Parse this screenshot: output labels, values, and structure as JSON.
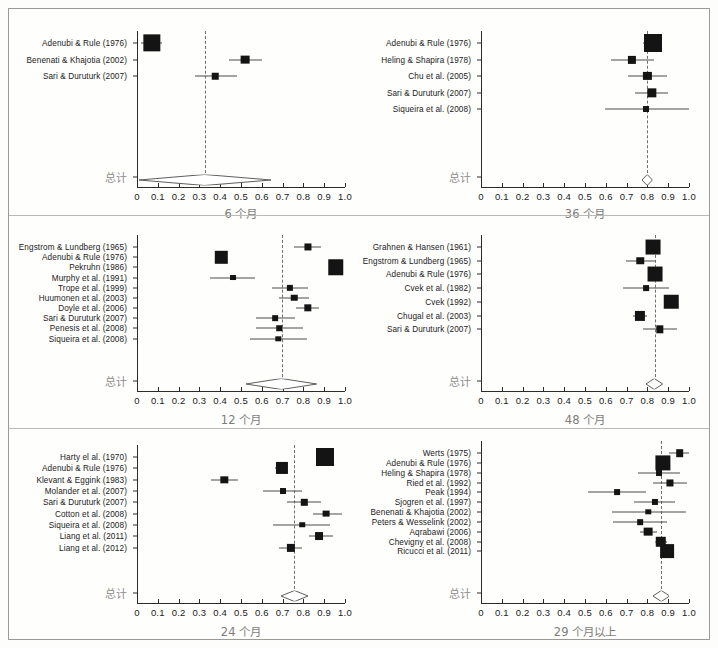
{
  "figure": {
    "x_tick_labels": [
      "0",
      "0.1",
      "0.2",
      "0.3",
      "0.4",
      "0.5",
      "0.6",
      "0.7",
      "0.8",
      "0.9",
      "1.0"
    ],
    "x_ticks": [
      0,
      0.1,
      0.2,
      0.3,
      0.4,
      0.5,
      0.6,
      0.7,
      0.8,
      0.9,
      1.0
    ],
    "summary_row_label": "总计",
    "xlim": [
      0,
      1.0
    ],
    "grid": false,
    "legend": "none"
  },
  "chart_data": [
    {
      "type": "forest",
      "panel_index": 0,
      "title": "6 个月",
      "xlabel": "6 个月",
      "ylabel": "",
      "xlim": [
        0,
        1.0
      ],
      "xticks": [
        0,
        0.1,
        0.2,
        0.3,
        0.4,
        0.5,
        0.6,
        0.7,
        0.8,
        0.9,
        1.0
      ],
      "reference_line": 0.325,
      "studies": [
        {
          "label": "Adenubi & Rule (1976)",
          "estimate": 0.07,
          "ci_low": 0.02,
          "ci_high": 0.12,
          "weight": 0.95
        },
        {
          "label": "Benenati & Khajotia (2002)",
          "estimate": 0.52,
          "ci_low": 0.44,
          "ci_high": 0.6,
          "weight": 0.34
        },
        {
          "label": "Sari & Duruturk (2007)",
          "estimate": 0.375,
          "ci_low": 0.28,
          "ci_high": 0.48,
          "weight": 0.18
        }
      ],
      "summary": {
        "label": "总计",
        "estimate": 0.325,
        "ci_low": 0.01,
        "ci_high": 0.645
      }
    },
    {
      "type": "forest",
      "panel_index": 1,
      "title": "36 个月",
      "xlabel": "36 个月",
      "ylabel": "",
      "xlim": [
        0,
        1.0
      ],
      "xticks": [
        0,
        0.1,
        0.2,
        0.3,
        0.4,
        0.5,
        0.6,
        0.7,
        0.8,
        0.9,
        1.0
      ],
      "reference_line": 0.8,
      "studies": [
        {
          "label": "Adenubi & Rule (1976)",
          "estimate": 0.825,
          "ci_low": 0.78,
          "ci_high": 0.87,
          "weight": 1.0
        },
        {
          "label": "Heling & Shapira (1978)",
          "estimate": 0.725,
          "ci_low": 0.625,
          "ci_high": 0.83,
          "weight": 0.3
        },
        {
          "label": "Chu et al. (2005)",
          "estimate": 0.8,
          "ci_low": 0.705,
          "ci_high": 0.895,
          "weight": 0.3
        },
        {
          "label": "Sari & Duruturk (2007)",
          "estimate": 0.82,
          "ci_low": 0.74,
          "ci_high": 0.9,
          "weight": 0.38
        },
        {
          "label": "Siqueira et al. (2008)",
          "estimate": 0.795,
          "ci_low": 0.595,
          "ci_high": 1.0,
          "weight": 0.14
        }
      ],
      "summary": {
        "label": "总计",
        "estimate": 0.8,
        "ci_low": 0.775,
        "ci_high": 0.825
      }
    },
    {
      "type": "forest",
      "panel_index": 2,
      "title": "12 个月",
      "xlabel": "12 个月",
      "ylabel": "",
      "xlim": [
        0,
        1.0
      ],
      "xticks": [
        0,
        0.1,
        0.2,
        0.3,
        0.4,
        0.5,
        0.6,
        0.7,
        0.8,
        0.9,
        1.0
      ],
      "reference_line": 0.695,
      "studies": [
        {
          "label": "Engstrom & Lundberg (1965)",
          "estimate": 0.82,
          "ci_low": 0.755,
          "ci_high": 0.885,
          "weight": 0.22
        },
        {
          "label": "Adenubi & Rule (1976)",
          "estimate": 0.405,
          "ci_low": 0.375,
          "ci_high": 0.435,
          "weight": 0.6
        },
        {
          "label": "Pekruhn (1986)",
          "estimate": 0.955,
          "ci_low": 0.935,
          "ci_high": 0.975,
          "weight": 0.82
        },
        {
          "label": "Murphy et al. (1991)",
          "estimate": 0.46,
          "ci_low": 0.35,
          "ci_high": 0.565,
          "weight": 0.14
        },
        {
          "label": "Trope et al. (1999)",
          "estimate": 0.735,
          "ci_low": 0.65,
          "ci_high": 0.82,
          "weight": 0.16
        },
        {
          "label": "Huumonen et al. (2003)",
          "estimate": 0.755,
          "ci_low": 0.685,
          "ci_high": 0.825,
          "weight": 0.18
        },
        {
          "label": "Doyle et al. (2006)",
          "estimate": 0.82,
          "ci_low": 0.765,
          "ci_high": 0.875,
          "weight": 0.24
        },
        {
          "label": "Sari & Duruturk (2007)",
          "estimate": 0.665,
          "ci_low": 0.57,
          "ci_high": 0.76,
          "weight": 0.12
        },
        {
          "label": "Penesis et al. (2008)",
          "estimate": 0.685,
          "ci_low": 0.57,
          "ci_high": 0.8,
          "weight": 0.11
        },
        {
          "label": "Siqueira et al. (2008)",
          "estimate": 0.68,
          "ci_low": 0.545,
          "ci_high": 0.815,
          "weight": 0.1
        }
      ],
      "summary": {
        "label": "总计",
        "estimate": 0.695,
        "ci_low": 0.525,
        "ci_high": 0.865
      }
    },
    {
      "type": "forest",
      "panel_index": 3,
      "title": "48 个月",
      "xlabel": "48 个月",
      "ylabel": "",
      "xlim": [
        0,
        1.0
      ],
      "xticks": [
        0,
        0.1,
        0.2,
        0.3,
        0.4,
        0.5,
        0.6,
        0.7,
        0.8,
        0.9,
        1.0
      ],
      "reference_line": 0.835,
      "studies": [
        {
          "label": "Grahnen & Hansen (1961)",
          "estimate": 0.825,
          "ci_low": 0.795,
          "ci_high": 0.855,
          "weight": 0.78
        },
        {
          "label": "Engstrom & Lundberg (1965)",
          "estimate": 0.765,
          "ci_low": 0.695,
          "ci_high": 0.835,
          "weight": 0.25
        },
        {
          "label": "Adenubi & Rule (1976)",
          "estimate": 0.835,
          "ci_low": 0.805,
          "ci_high": 0.865,
          "weight": 0.78
        },
        {
          "label": "Cvek et al. (1982)",
          "estimate": 0.795,
          "ci_low": 0.685,
          "ci_high": 0.905,
          "weight": 0.13
        },
        {
          "label": "Cvek (1992)",
          "estimate": 0.915,
          "ci_low": 0.885,
          "ci_high": 0.945,
          "weight": 0.75
        },
        {
          "label": "Chugal et al. (2003)",
          "estimate": 0.765,
          "ci_low": 0.73,
          "ci_high": 0.8,
          "weight": 0.44
        },
        {
          "label": "Sari & Duruturk (2007)",
          "estimate": 0.86,
          "ci_low": 0.78,
          "ci_high": 0.94,
          "weight": 0.24
        }
      ],
      "summary": {
        "label": "总计",
        "estimate": 0.835,
        "ci_low": 0.795,
        "ci_high": 0.875
      }
    },
    {
      "type": "forest",
      "panel_index": 4,
      "title": "24 个月",
      "xlabel": "24 个月",
      "ylabel": "",
      "xlim": [
        0,
        1.0
      ],
      "xticks": [
        0,
        0.1,
        0.2,
        0.3,
        0.4,
        0.5,
        0.6,
        0.7,
        0.8,
        0.9,
        1.0
      ],
      "reference_line": 0.755,
      "studies": [
        {
          "label": "Harty el al. (1970)",
          "estimate": 0.905,
          "ci_low": 0.885,
          "ci_high": 0.925,
          "weight": 1.0
        },
        {
          "label": "Adenubi & Rule (1976)",
          "estimate": 0.695,
          "ci_low": 0.665,
          "ci_high": 0.725,
          "weight": 0.58
        },
        {
          "label": "Klevant & Eggink (1983)",
          "estimate": 0.42,
          "ci_low": 0.355,
          "ci_high": 0.485,
          "weight": 0.24
        },
        {
          "label": "Molander et al. (2007)",
          "estimate": 0.7,
          "ci_low": 0.605,
          "ci_high": 0.795,
          "weight": 0.14
        },
        {
          "label": "Sari & Duruturk (2007)",
          "estimate": 0.805,
          "ci_low": 0.72,
          "ci_high": 0.885,
          "weight": 0.17
        },
        {
          "label": "Cotton et al. (2008)",
          "estimate": 0.91,
          "ci_low": 0.845,
          "ci_high": 0.985,
          "weight": 0.2
        },
        {
          "label": "Siqueira et al. (2008)",
          "estimate": 0.795,
          "ci_low": 0.655,
          "ci_high": 0.93,
          "weight": 0.11
        },
        {
          "label": "Liang et al. (2011)",
          "estimate": 0.875,
          "ci_low": 0.825,
          "ci_high": 0.94,
          "weight": 0.28
        },
        {
          "label": "Liang et al. (2012)",
          "estimate": 0.74,
          "ci_low": 0.685,
          "ci_high": 0.795,
          "weight": 0.3
        }
      ],
      "summary": {
        "label": "总计",
        "estimate": 0.755,
        "ci_low": 0.69,
        "ci_high": 0.82
      }
    },
    {
      "type": "forest",
      "panel_index": 5,
      "title": "29 个月以上",
      "xlabel": "29 个月以上",
      "ylabel": "",
      "xlim": [
        0,
        1.0
      ],
      "xticks": [
        0,
        0.1,
        0.2,
        0.3,
        0.4,
        0.5,
        0.6,
        0.7,
        0.8,
        0.9,
        1.0
      ],
      "reference_line": 0.865,
      "studies": [
        {
          "label": "Werts (1975)",
          "estimate": 0.955,
          "ci_low": 0.905,
          "ci_high": 1.0,
          "weight": 0.26
        },
        {
          "label": "Adenubi & Rule (1976)",
          "estimate": 0.875,
          "ci_low": 0.855,
          "ci_high": 0.895,
          "weight": 0.8
        },
        {
          "label": "Heling & Shapira (1978)",
          "estimate": 0.855,
          "ci_low": 0.755,
          "ci_high": 0.955,
          "weight": 0.14
        },
        {
          "label": "Ried et al. (1992)",
          "estimate": 0.91,
          "ci_low": 0.825,
          "ci_high": 0.99,
          "weight": 0.22
        },
        {
          "label": "Peak (1994)",
          "estimate": 0.655,
          "ci_low": 0.515,
          "ci_high": 0.795,
          "weight": 0.13
        },
        {
          "label": "Sjogren et al. (1997)",
          "estimate": 0.835,
          "ci_low": 0.735,
          "ci_high": 0.935,
          "weight": 0.15
        },
        {
          "label": "Benenati & Khajotia (2002)",
          "estimate": 0.805,
          "ci_low": 0.63,
          "ci_high": 0.985,
          "weight": 0.1
        },
        {
          "label": "Peters & Wesselink (2002)",
          "estimate": 0.765,
          "ci_low": 0.635,
          "ci_high": 0.895,
          "weight": 0.12
        },
        {
          "label": "Aqrabawi (2006)",
          "estimate": 0.805,
          "ci_low": 0.765,
          "ci_high": 0.845,
          "weight": 0.34
        },
        {
          "label": "Chevigny et al. (2008)",
          "estimate": 0.865,
          "ci_low": 0.835,
          "ci_high": 0.895,
          "weight": 0.46
        },
        {
          "label": "Ricucci et al. (2011)",
          "estimate": 0.895,
          "ci_low": 0.865,
          "ci_high": 0.925,
          "weight": 0.7
        }
      ],
      "summary": {
        "label": "总计",
        "estimate": 0.865,
        "ci_low": 0.825,
        "ci_high": 0.905
      }
    }
  ],
  "colors": {
    "box": "#141414",
    "ci": "#4a4a4a",
    "axis": "#2b2b2b",
    "reference": "#6f6f6f",
    "total_text": "#8d8d8a",
    "title_text": "#7d7d7a",
    "frame": "#9a9a96",
    "background": "#fefefd"
  }
}
